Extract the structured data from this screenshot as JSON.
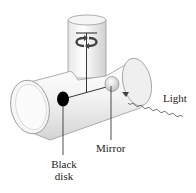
{
  "diagram": {
    "type": "physics-apparatus",
    "labels": {
      "light": "Light",
      "mirror": "Mirror",
      "black_disk_line1": "Black",
      "black_disk_line2": "disk"
    },
    "components": [
      {
        "name": "horizontal-tube",
        "role": "glass tube"
      },
      {
        "name": "vertical-tube",
        "role": "glass tube housing suspension fiber"
      },
      {
        "name": "suspension-fiber",
        "role": "torsion fiber"
      },
      {
        "name": "rotation-arrow",
        "role": "indicates twisting of fiber"
      },
      {
        "name": "black-disk",
        "role": "absorbing target"
      },
      {
        "name": "mirror",
        "role": "reflecting target"
      },
      {
        "name": "light-ray",
        "role": "incident light (wavy)"
      }
    ],
    "colors": {
      "tube_fill": "#f2f2f2",
      "tube_shade": "#d9d9d9",
      "outline": "#8a8a8a",
      "disk": "#000000",
      "mirror": "#e6e6e6",
      "line": "#222222"
    }
  }
}
